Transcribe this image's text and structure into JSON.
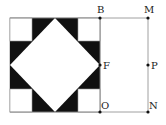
{
  "diagram": {
    "type": "geometry-figure",
    "colors": {
      "background": "#ffffff",
      "fill_dark": "#111111",
      "line": "#888888",
      "point": "#111111",
      "label": "#222222"
    },
    "points": [
      {
        "id": "B",
        "label": "B",
        "x": 100,
        "y": 18,
        "label_dx": -2,
        "label_dy": -5
      },
      {
        "id": "M",
        "label": "M",
        "x": 148,
        "y": 18,
        "label_dx": -3,
        "label_dy": -5
      },
      {
        "id": "F",
        "label": "F",
        "x": 100,
        "y": 65,
        "label_dx": 3,
        "label_dy": 4
      },
      {
        "id": "P",
        "label": "P",
        "x": 148,
        "y": 65,
        "label_dx": 3,
        "label_dy": 4
      },
      {
        "id": "O",
        "label": "O",
        "x": 100,
        "y": 112,
        "label_dx": 1,
        "label_dy": -3
      },
      {
        "id": "N",
        "label": "N",
        "x": 148,
        "y": 112,
        "label_dx": 1,
        "label_dy": -3
      }
    ]
  }
}
